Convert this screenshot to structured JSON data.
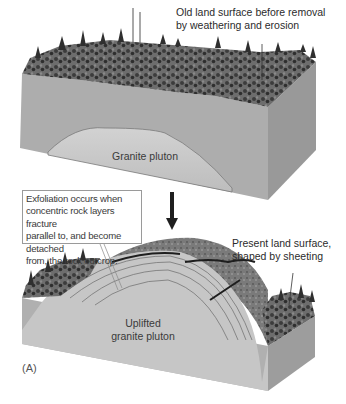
{
  "figure": {
    "panel_label": "(A)",
    "top_block": {
      "annotation": "Old land surface before removal by weathering and erosion",
      "annotation_lines": [
        "Old land surface before removal",
        "by weathering and erosion"
      ],
      "pluton_label": "Granite pluton"
    },
    "transition_arrow": "down-arrow-icon",
    "callout": {
      "text": "Exfoliation occurs when concentric rock layers fracture parallel to, and become detached from, the rock outcrop.",
      "lines": [
        "Exfoliation occurs when",
        "concentric rock layers fracture",
        "parallel to, and become detached",
        "from, the rock outcrop."
      ]
    },
    "bottom_block": {
      "annotation_lines": [
        "Present land surface,",
        "shaped by sheeting"
      ],
      "pluton_label_lines": [
        "Uplifted",
        "granite pluton"
      ]
    },
    "colors": {
      "block_front": "#a9a9a9",
      "block_side": "#9b9b9b",
      "pluton": "#c9c9c9",
      "forest": "#4a4a4a",
      "text": "#2b2b2b"
    }
  }
}
